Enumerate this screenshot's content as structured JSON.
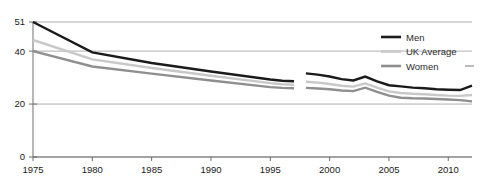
{
  "chart_data": {
    "type": "line",
    "title": "",
    "subtitle": "",
    "xlabel": "",
    "ylabel": "",
    "xlim": [
      1975,
      2012
    ],
    "ylim": [
      0,
      51
    ],
    "grid": true,
    "grid_axis": "y",
    "legend_position": "top-right",
    "x_tick_labels": [
      "1975",
      "1980",
      "1985",
      "1990",
      "1995",
      "2000",
      "2005",
      "2010"
    ],
    "x_ticks": [
      1975,
      1980,
      1985,
      1990,
      1995,
      2000,
      2005,
      2010
    ],
    "y_tick_labels": [
      "0",
      "20",
      "40",
      "51"
    ],
    "y_ticks": [
      0,
      20,
      40,
      51
    ],
    "series": [
      {
        "name": "Men",
        "color": "#1a1a1a",
        "width": 2.4,
        "break_after_x": 1997,
        "x": [
          1975,
          1980,
          1985,
          1990,
          1995,
          1996,
          1997,
          1998,
          1999,
          2000,
          2001,
          2002,
          2003,
          2004,
          2005,
          2006,
          2007,
          2008,
          2009,
          2010,
          2011,
          2012
        ],
        "values": [
          51,
          39.5,
          35.5,
          32.3,
          29.3,
          28.8,
          28.6,
          31.6,
          31.1,
          30.4,
          29.4,
          28.9,
          30.4,
          28.6,
          27.1,
          26.7,
          26.2,
          26.0,
          25.6,
          25.4,
          25.3,
          27.0
        ]
      },
      {
        "name": "UK Average",
        "color": "#c8c8c8",
        "width": 2.4,
        "break_after_x": 1997,
        "x": [
          1975,
          1980,
          1985,
          1990,
          1995,
          1996,
          1997,
          1998,
          1999,
          2000,
          2001,
          2002,
          2003,
          2004,
          2005,
          2006,
          2007,
          2008,
          2009,
          2010,
          2011,
          2012
        ],
        "values": [
          44.2,
          36.9,
          33.6,
          30.7,
          27.9,
          27.5,
          27.3,
          28.4,
          28.1,
          27.6,
          26.9,
          26.6,
          27.8,
          26.2,
          24.8,
          24.2,
          23.9,
          23.7,
          23.4,
          23.2,
          23.1,
          23.4
        ]
      },
      {
        "name": "Women",
        "color": "#8f8f8f",
        "width": 2.4,
        "break_after_x": 1997,
        "x": [
          1975,
          1980,
          1985,
          1990,
          1995,
          1996,
          1997,
          1998,
          1999,
          2000,
          2001,
          2002,
          2003,
          2004,
          2005,
          2006,
          2007,
          2008,
          2009,
          2010,
          2011,
          2012
        ],
        "values": [
          40,
          34.2,
          31.5,
          28.9,
          26.4,
          26.1,
          26.0,
          26.1,
          25.9,
          25.6,
          25.1,
          24.9,
          26.2,
          24.6,
          23.2,
          22.4,
          22.2,
          22.1,
          21.9,
          21.7,
          21.5,
          21.0
        ]
      }
    ],
    "legend_entries": [
      {
        "label": "Men",
        "color": "#1a1a1a"
      },
      {
        "label": "UK Average",
        "color": "#c8c8c8"
      },
      {
        "label": "Women",
        "color": "#8f8f8f"
      }
    ]
  }
}
